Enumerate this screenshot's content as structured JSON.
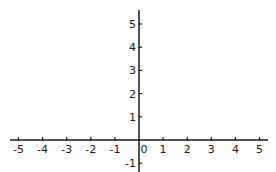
{
  "chart_data": {
    "type": "line",
    "title": "",
    "xlabel": "",
    "ylabel": "",
    "xlim": [
      -5.5,
      5.5
    ],
    "ylim": [
      -1.2,
      5.6
    ],
    "grid": false,
    "legend": null,
    "x_ticks": [
      -5,
      -4,
      -3,
      -2,
      -1,
      0,
      1,
      2,
      3,
      4,
      5
    ],
    "x_tick_labels": [
      "-5",
      "-4",
      "-3",
      "-2",
      "-1",
      "0",
      "1",
      "2",
      "3",
      "4",
      "5"
    ],
    "y_ticks": [
      1,
      2,
      3,
      4,
      5,
      -1
    ],
    "y_tick_labels": [
      "1",
      "2",
      "3",
      "4",
      "5",
      "-1"
    ],
    "series": []
  },
  "colors": {
    "axis": "#1a1a1a",
    "background": "#ffffff"
  }
}
